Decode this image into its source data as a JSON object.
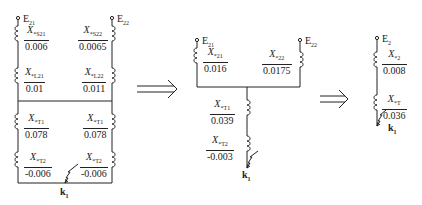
{
  "diagrams": [
    {
      "name": "original-network",
      "sources": [
        {
          "label": "E",
          "sub": "21"
        },
        {
          "label": "E",
          "sub": "22"
        }
      ],
      "reactances": [
        {
          "symbol": "X",
          "sub": "*S21",
          "value": "0.006"
        },
        {
          "symbol": "X",
          "sub": "*S22",
          "value": "0.0065"
        },
        {
          "symbol": "X",
          "sub": "*L21",
          "value": "0.01"
        },
        {
          "symbol": "X",
          "sub": "*L22",
          "value": "0.011"
        },
        {
          "symbol": "X",
          "sub": "*T1",
          "value": "0.078"
        },
        {
          "symbol": "X",
          "sub": "*T1",
          "value": "0.078"
        },
        {
          "symbol": "X",
          "sub": "*T2",
          "value": "-0.006"
        },
        {
          "symbol": "X",
          "sub": "*T2",
          "value": "-0.006"
        }
      ],
      "fault": {
        "label": "k",
        "sub": "1"
      }
    },
    {
      "name": "reduced-network",
      "sources": [
        {
          "label": "E",
          "sub": "21"
        },
        {
          "label": "E",
          "sub": "22"
        }
      ],
      "reactances": [
        {
          "symbol": "X",
          "sub": "*21",
          "value": "0.016"
        },
        {
          "symbol": "X",
          "sub": "*22",
          "value": "0.0175"
        },
        {
          "symbol": "X",
          "sub": "*T1",
          "value": "0.039"
        },
        {
          "symbol": "X",
          "sub": "*T2",
          "value": "-0.003"
        }
      ],
      "fault": {
        "label": "k",
        "sub": "1"
      }
    },
    {
      "name": "equivalent-network",
      "sources": [
        {
          "label": "E",
          "sub": "2"
        }
      ],
      "reactances": [
        {
          "symbol": "X",
          "sub": "*2",
          "value": "0.008"
        },
        {
          "symbol": "X",
          "sub": "*T",
          "value": "0.036"
        }
      ],
      "fault": {
        "label": "k",
        "sub": "1"
      }
    }
  ],
  "arrows": [
    "implies-arrow",
    "implies-arrow"
  ],
  "colors": {
    "line": "#222222",
    "background": "#ffffff"
  }
}
